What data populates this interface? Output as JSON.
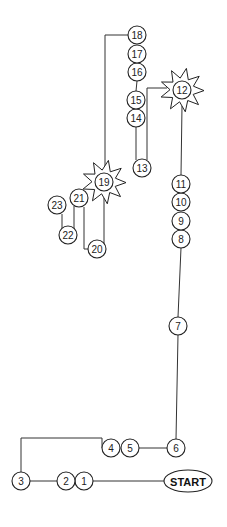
{
  "diagram": {
    "title": "",
    "start_label": "START",
    "colors": {
      "stroke": "#222222",
      "background": "#ffffff"
    },
    "nodes": [
      {
        "id": "start",
        "label": "START",
        "shape": "ellipse"
      },
      {
        "id": "1",
        "label": "1",
        "shape": "circle"
      },
      {
        "id": "2",
        "label": "2",
        "shape": "circle"
      },
      {
        "id": "3",
        "label": "3",
        "shape": "circle"
      },
      {
        "id": "4",
        "label": "4",
        "shape": "circle"
      },
      {
        "id": "5",
        "label": "5",
        "shape": "circle"
      },
      {
        "id": "6",
        "label": "6",
        "shape": "circle"
      },
      {
        "id": "7",
        "label": "7",
        "shape": "circle"
      },
      {
        "id": "8",
        "label": "8",
        "shape": "circle"
      },
      {
        "id": "9",
        "label": "9",
        "shape": "circle"
      },
      {
        "id": "10",
        "label": "10",
        "shape": "circle"
      },
      {
        "id": "11",
        "label": "11",
        "shape": "circle"
      },
      {
        "id": "12",
        "label": "12",
        "shape": "star"
      },
      {
        "id": "13",
        "label": "13",
        "shape": "circle"
      },
      {
        "id": "14",
        "label": "14",
        "shape": "circle"
      },
      {
        "id": "15",
        "label": "15",
        "shape": "circle"
      },
      {
        "id": "16",
        "label": "16",
        "shape": "circle"
      },
      {
        "id": "17",
        "label": "17",
        "shape": "circle"
      },
      {
        "id": "18",
        "label": "18",
        "shape": "circle"
      },
      {
        "id": "19",
        "label": "19",
        "shape": "star"
      },
      {
        "id": "20",
        "label": "20",
        "shape": "circle"
      },
      {
        "id": "21",
        "label": "21",
        "shape": "circle"
      },
      {
        "id": "22",
        "label": "22",
        "shape": "circle"
      },
      {
        "id": "23",
        "label": "23",
        "shape": "circle"
      }
    ],
    "sequence": [
      "start",
      "1",
      "2",
      "3",
      "4",
      "5",
      "6",
      "7",
      "8",
      "9",
      "10",
      "11",
      "12",
      "13",
      "14",
      "15",
      "16",
      "17",
      "18",
      "19",
      "20",
      "21",
      "22",
      "23"
    ]
  }
}
